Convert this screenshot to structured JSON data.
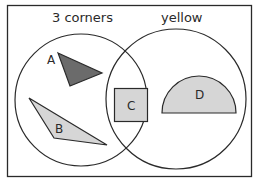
{
  "diagram": {
    "type": "venn",
    "colors": {
      "background": "#ffffff",
      "stroke": "#2a2a2a",
      "dark_fill": "#6b6b6b",
      "light_fill": "#d6d6d6"
    },
    "sets": [
      {
        "id": "left",
        "label": "3 corners"
      },
      {
        "id": "right",
        "label": "yellow"
      }
    ],
    "shapes": [
      {
        "id": "A",
        "label": "A",
        "kind": "triangle",
        "fill": "dark",
        "region": "3 corners only"
      },
      {
        "id": "B",
        "label": "B",
        "kind": "triangle",
        "fill": "light",
        "region": "3 corners only"
      },
      {
        "id": "C",
        "label": "C",
        "kind": "square",
        "fill": "light",
        "region": "both"
      },
      {
        "id": "D",
        "label": "D",
        "kind": "semicircle",
        "fill": "light",
        "region": "yellow only"
      }
    ]
  }
}
